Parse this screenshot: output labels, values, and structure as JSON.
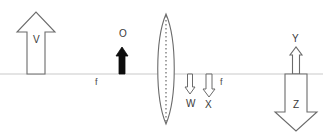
{
  "diagram": {
    "type": "optics-ray-diagram",
    "width": 323,
    "height": 139,
    "background_color": "#ffffff",
    "stroke_color": "#5a5a5a",
    "axis_color": "#c9c9c9",
    "solid_fill_color": "#000000",
    "label_color": "#3a3a3a",
    "axis": {
      "name": "principal-axis",
      "y": 74,
      "x_start": 0,
      "x_end": 323
    },
    "lens": {
      "name": "converging-lens",
      "shape": "biconvex",
      "center_x": 166,
      "top_y": 14,
      "bottom_y": 124,
      "half_width": 11,
      "center_line_style": "dotted"
    },
    "focal_points": [
      {
        "label": "f",
        "side": "left",
        "x": 97,
        "y": 82
      },
      {
        "label": "f",
        "side": "right",
        "x": 222,
        "y": 82
      }
    ],
    "arrows": [
      {
        "label": "V",
        "name": "arrow-v",
        "direction": "up",
        "fill": "hollow",
        "size": "large",
        "center_x": 36,
        "base_y": 74,
        "tip_y": 12,
        "shaft_half_width": 9,
        "head_half_width": 19,
        "head_height": 20,
        "label_x": 33,
        "label_y": 35
      },
      {
        "label": "O",
        "name": "arrow-o-object",
        "direction": "up",
        "fill": "solid",
        "size": "small",
        "center_x": 122,
        "base_y": 74,
        "tip_y": 47,
        "shaft_half_width": 3,
        "head_half_width": 6,
        "head_height": 9,
        "label_x": 119,
        "label_y": 29
      },
      {
        "label": "W",
        "name": "arrow-w",
        "direction": "down",
        "fill": "hollow",
        "size": "tiny",
        "center_x": 190,
        "base_y": 74,
        "tip_y": 94,
        "shaft_half_width": 2.5,
        "head_half_width": 5,
        "head_height": 7,
        "label_x": 186,
        "label_y": 99
      },
      {
        "label": "X",
        "name": "arrow-x",
        "direction": "down",
        "fill": "hollow",
        "size": "small",
        "center_x": 209,
        "base_y": 74,
        "tip_y": 97,
        "shaft_half_width": 3,
        "head_half_width": 6,
        "head_height": 8,
        "label_x": 205,
        "label_y": 100
      },
      {
        "label": "Y",
        "name": "arrow-y",
        "direction": "up",
        "fill": "hollow",
        "size": "narrow",
        "center_x": 296,
        "base_y": 74,
        "tip_y": 47,
        "shaft_half_width": 3.5,
        "head_half_width": 6,
        "head_height": 8,
        "label_x": 292,
        "label_y": 34
      },
      {
        "label": "Z",
        "name": "arrow-z",
        "direction": "down",
        "fill": "hollow",
        "size": "large",
        "center_x": 296,
        "base_y": 74,
        "tip_y": 131,
        "shaft_half_width": 11,
        "head_half_width": 21,
        "head_height": 19,
        "label_x": 293,
        "label_y": 100
      }
    ]
  }
}
